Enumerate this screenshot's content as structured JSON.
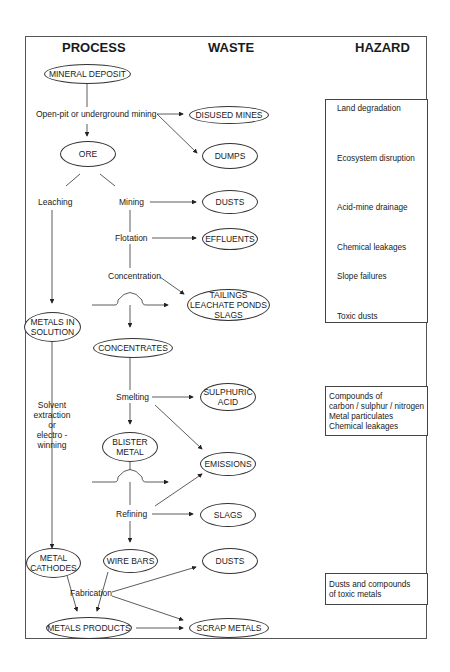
{
  "headers": {
    "process": "PROCESS",
    "waste": "WASTE",
    "hazard": "HAZARD"
  },
  "process_nodes": {
    "mineral_deposit": "MINERAL DEPOSIT",
    "ore": "ORE",
    "metals_in_solution_1": "METALS IN",
    "metals_in_solution_2": "SOLUTION",
    "concentrates": "CONCENTRATES",
    "blister_metal_1": "BLISTER",
    "blister_metal_2": "METAL",
    "metal_cathodes_1": "METAL",
    "metal_cathodes_2": "CATHODES",
    "wire_bars": "WIRE BARS",
    "metals_products": "METALS PRODUCTS"
  },
  "process_steps": {
    "mining_method": "Open-pit or underground mining",
    "leaching": "Leaching",
    "mining": "Mining",
    "flotation": "Flotation",
    "concentration": "Concentration",
    "smelting": "Smelting",
    "solvent_1": "Solvent",
    "solvent_2": "extraction",
    "solvent_3": "or",
    "solvent_4": "electro -",
    "solvent_5": "winning",
    "refining": "Refining",
    "fabrication": "Fabrication"
  },
  "waste_nodes": {
    "disused_mines": "DISUSED MINES",
    "dumps": "DUMPS",
    "dusts_1": "DUSTS",
    "effluents": "EFFLUENTS",
    "tailings_1": "TAILINGS",
    "tailings_2": "LEACHATE PONDS",
    "tailings_3": "SLAGS",
    "sulphuric_1": "SULPHURIC",
    "sulphuric_2": "ACID",
    "emissions": "EMISSIONS",
    "slags": "SLAGS",
    "dusts_2": "DUSTS",
    "scrap_metals": "SCRAP METALS"
  },
  "hazards": {
    "group1": [
      "Land degradation",
      "Ecosystem disruption",
      "Acid-mine drainage",
      "Chemical leakages",
      "Slope failures",
      "Toxic dusts"
    ],
    "group2": [
      "Compounds of",
      "carbon / sulphur / nitrogen",
      "Metal particulates",
      "Chemical leakages"
    ],
    "group3": [
      "Dusts and compounds",
      "of toxic metals"
    ]
  }
}
